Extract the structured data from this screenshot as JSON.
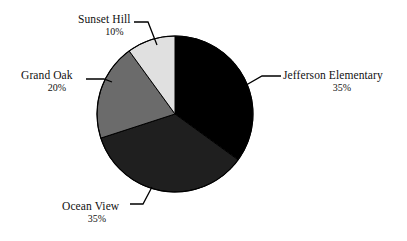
{
  "chart_data": {
    "type": "pie",
    "title": "",
    "labels": [
      "Jefferson Elementary",
      "Ocean View",
      "Grand Oak",
      "Sunset Hill"
    ],
    "values": [
      35,
      35,
      20,
      10
    ],
    "value_labels": [
      "35%",
      "35%",
      "20%",
      "10%"
    ],
    "unit": "%",
    "total": 100,
    "start_angle_deg": 0,
    "direction": "clockwise",
    "legend": "none",
    "labels_position": "outside-with-leader-lines",
    "grid": false,
    "background_color": "#ffffff",
    "slice_colors": [
      "#000000",
      "#1f1f1f",
      "#6b6b6b",
      "#e0e0e0"
    ],
    "slices": [
      {
        "name": "Jefferson Elementary",
        "value": 35,
        "value_label": "35%",
        "color": "#000000",
        "start_deg": 0,
        "end_deg": 126
      },
      {
        "name": "Ocean View",
        "value": 35,
        "value_label": "35%",
        "color": "#1f1f1f",
        "start_deg": 126,
        "end_deg": 252
      },
      {
        "name": "Grand Oak",
        "value": 20,
        "value_label": "20%",
        "color": "#6b6b6b",
        "start_deg": 252,
        "end_deg": 324
      },
      {
        "name": "Sunset Hill",
        "value": 10,
        "value_label": "10%",
        "color": "#e0e0e0",
        "start_deg": 324,
        "end_deg": 360
      }
    ]
  },
  "geometry": {
    "center_x": 175,
    "center_y": 114,
    "radius": 78,
    "outline_color": "#000000"
  }
}
